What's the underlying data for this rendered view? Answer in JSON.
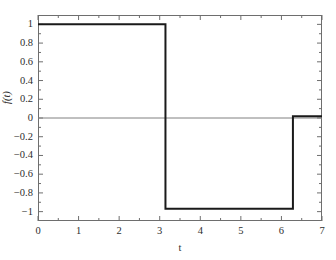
{
  "chart_data": {
    "type": "line",
    "title": "",
    "subtitle": "",
    "xlabel": "t",
    "ylabel": "f(t)",
    "xlim": [
      0,
      7
    ],
    "ylim": [
      -1.1,
      1.1
    ],
    "grid": false,
    "legend": null,
    "frame": "box",
    "tick_direction": "in",
    "zero_line": true,
    "zero_line_color": "#808080",
    "line_color": "#1a1a1a",
    "line_width": 2,
    "axis_color": "#6e6e6e",
    "xticks": [
      0,
      1,
      2,
      3,
      4,
      5,
      6,
      7
    ],
    "xtick_labels": [
      "0",
      "1",
      "2",
      "3",
      "4",
      "5",
      "6",
      "7"
    ],
    "yticks": [
      1,
      0.8,
      0.6,
      0.4,
      0.2,
      0,
      -0.2,
      -0.4,
      -0.6,
      -0.8,
      -1
    ],
    "ytick_labels": [
      "1",
      "0.8",
      "0.6",
      "0.4",
      "0.2",
      "0",
      "−0.2",
      "−0.4",
      "−0.6",
      "−0.8",
      "−1"
    ],
    "xminor_ticks": [
      0.5,
      1.5,
      2.5,
      3.5,
      4.5,
      5.5,
      6.5
    ],
    "yminor_ticks": [
      0.9,
      0.7,
      0.5,
      0.3,
      0.1,
      -0.1,
      -0.3,
      -0.5,
      -0.7,
      -0.9
    ],
    "series": [
      {
        "name": "f(t)",
        "x": [
          0,
          3.1416,
          3.1416,
          6.2832,
          6.2832,
          7
        ],
        "y": [
          1,
          1,
          -0.97,
          -0.97,
          0.02,
          0.02
        ]
      }
    ]
  }
}
